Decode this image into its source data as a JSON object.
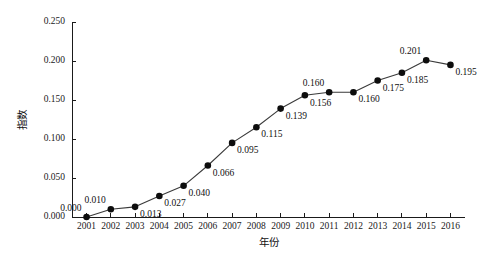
{
  "chart_data": {
    "type": "line",
    "title": "",
    "xlabel": "年份",
    "ylabel": "指数",
    "xlim": [
      2000.4,
      2016.6
    ],
    "ylim": [
      0.0,
      0.25
    ],
    "grid": false,
    "legend": null,
    "marker": "filled-circle",
    "show_point_labels": true,
    "categories": [
      "2001",
      "2002",
      "2003",
      "2004",
      "2005",
      "2006",
      "2007",
      "2008",
      "2009",
      "2010",
      "2011",
      "2012",
      "2013",
      "2014",
      "2015",
      "2016"
    ],
    "x": [
      2001,
      2002,
      2003,
      2004,
      2005,
      2006,
      2007,
      2008,
      2009,
      2010,
      2011,
      2012,
      2013,
      2014,
      2015,
      2016
    ],
    "values": [
      0.0,
      0.01,
      0.013,
      0.027,
      0.04,
      0.066,
      0.095,
      0.115,
      0.139,
      0.156,
      0.16,
      0.16,
      0.175,
      0.185,
      0.201,
      0.195
    ],
    "point_labels": [
      "0.000",
      "0.010",
      "0.013",
      "0.027",
      "0.040",
      "0.066",
      "0.095",
      "0.115",
      "0.139",
      "0.156",
      "0.160",
      "0.160",
      "0.175",
      "0.185",
      "0.201",
      "0.195"
    ],
    "label_positions": [
      "above-left",
      "above-left",
      "below-right",
      "below-right",
      "below-right",
      "below-right",
      "below-right",
      "below-right",
      "below-right",
      "below-right",
      "above-left",
      "below-right",
      "below-right",
      "below-right",
      "above-left",
      "below-right"
    ],
    "ytick_values": [
      0.0,
      0.05,
      0.1,
      0.15,
      0.2,
      0.25
    ],
    "ytick_labels": [
      "0.000",
      "0.050",
      "0.100",
      "0.150",
      "0.200",
      "0.250"
    ],
    "xtick_labels": [
      "2001",
      "2002",
      "2003",
      "2004",
      "2005",
      "2006",
      "2007",
      "2008",
      "2009",
      "2010",
      "2011",
      "2012",
      "2013",
      "2014",
      "2015",
      "2016"
    ],
    "colors": {
      "line": "#3a3a3a",
      "marker": "#0d0d0d",
      "axis": "#1a1a1a",
      "text": "#101010",
      "background": "#ffffff"
    }
  }
}
